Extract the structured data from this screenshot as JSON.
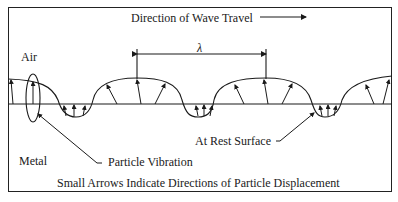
{
  "diagram": {
    "title": "Direction of Wave Travel",
    "labels": {
      "air": "Air",
      "metal": "Metal",
      "wavelength": "λ",
      "particle_vibration": "Particle Vibration",
      "at_rest_surface": "At Rest Surface",
      "caption": "Small Arrows Indicate Directions of Particle Displacement"
    },
    "colors": {
      "line": "#1a1a1a",
      "background": "#ffffff"
    }
  }
}
